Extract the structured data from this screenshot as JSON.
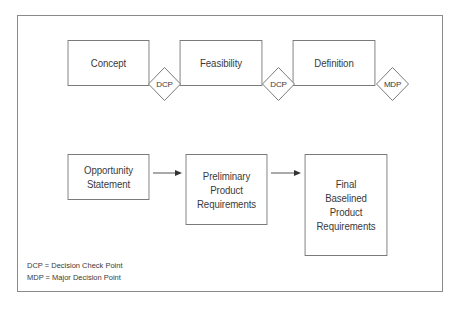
{
  "diagram": {
    "phases": [
      {
        "label": "Concept"
      },
      {
        "label": "Feasibility"
      },
      {
        "label": "Definition"
      }
    ],
    "decision_points": [
      {
        "label": "DCP"
      },
      {
        "label": "DCP"
      },
      {
        "label": "MDP"
      }
    ],
    "requirements_flow": [
      {
        "label": "Opportunity\nStatement"
      },
      {
        "label": "Preliminary\nProduct\nRequirements"
      },
      {
        "label": "Final\nBaselined\nProduct\nRequirements"
      }
    ],
    "legend": [
      {
        "text": "DCP = Decision Check Point"
      },
      {
        "text": "MDP = Major Decision Point"
      }
    ],
    "colors": {
      "border": "#7a7a7a",
      "text": "#3a3a3a",
      "background": "#ffffff"
    }
  }
}
